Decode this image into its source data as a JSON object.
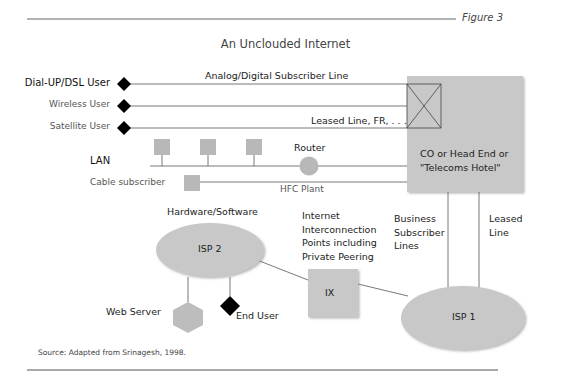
{
  "header": {
    "figure_label": "Figure 3",
    "title": "An Unclouded Internet"
  },
  "nodes": {
    "dialup_user": "Dial-UP/DSL User",
    "wireless_user": "Wireless User",
    "satellite_user": "Satellite User",
    "lan": "LAN",
    "cable_subscriber": "Cable subscriber",
    "router": "Router",
    "co_box_line1": "CO or Head End or",
    "co_box_line2": "\"Telecoms Hotel\"",
    "hardware_software": "Hardware/Software",
    "isp2": "ISP 2",
    "isp1": "ISP 1",
    "ix": "IX",
    "web_server": "Web Server",
    "end_user": "End User"
  },
  "links": {
    "analog_digital": "Analog/Digital Subscriber Line",
    "leased_line_fr": "Leased Line, FR, . . .",
    "hfc_plant": "HFC Plant",
    "internet_interconnection": [
      "Internet",
      "Interconnection",
      "Points including",
      "Private Peering"
    ],
    "business_subscriber": [
      "Business",
      "Subscriber",
      "Lines"
    ],
    "leased_line": [
      "Leased",
      "Line"
    ]
  },
  "footer": {
    "source": "Source:  Adapted from Srinagesh, 1998."
  },
  "colors": {
    "gray_fill": "#c6c6c6",
    "line": "#444444",
    "diamond": "#000000",
    "rule": "#555555"
  }
}
